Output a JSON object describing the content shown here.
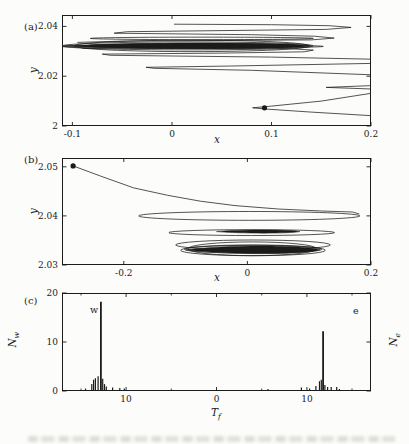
{
  "page": {
    "bg": "#fcfcfa",
    "ink": "#1b1b1b"
  },
  "panels": {
    "a": {
      "label": "(a)",
      "xlabel": "x",
      "ylabel": "y"
    },
    "b": {
      "label": "(b)",
      "xlabel": "x",
      "ylabel": "y"
    },
    "c": {
      "label": "(c)",
      "xlabel_main": "T",
      "xlabel_sub": "f",
      "ylabel_left_main": "N",
      "ylabel_left_sub": "w",
      "ylabel_right_main": "N",
      "ylabel_right_sub": "e",
      "west_label": "w",
      "east_label": "e"
    }
  },
  "chart_data": [
    {
      "id": "a",
      "type": "line",
      "xlabel": "x",
      "ylabel": "y",
      "xlim": [
        -0.1105,
        0.2
      ],
      "ylim": [
        2.0,
        2.0446
      ],
      "xticks": [
        {
          "v": -0.1,
          "label": "-0.1"
        },
        {
          "v": 0,
          "label": "0"
        },
        {
          "v": 0.1,
          "label": "0.1"
        },
        {
          "v": 0.2,
          "label": "0.2"
        }
      ],
      "yticks": [
        {
          "v": 2,
          "label": "2"
        },
        {
          "v": 2.02,
          "label": "2.02"
        },
        {
          "v": 2.04,
          "label": "2.04"
        }
      ],
      "start_marker": {
        "x": 0.093,
        "y": 2.0073
      },
      "polylines": [
        [
          [
            0.206,
            2.004
          ],
          [
            0.14,
            2.0056
          ],
          [
            0.095,
            2.0068
          ],
          [
            0.081,
            2.0073
          ],
          [
            0.1,
            2.008
          ],
          [
            0.15,
            2.01
          ],
          [
            0.206,
            2.0135
          ]
        ],
        [
          [
            0.206,
            2.0148
          ],
          [
            0.155,
            2.0155
          ],
          [
            0.206,
            2.0163
          ]
        ],
        [
          [
            0.206,
            2.0205
          ],
          [
            0.08,
            2.0224
          ],
          [
            -0.018,
            2.0232
          ],
          [
            -0.026,
            2.0236
          ],
          [
            0.06,
            2.0241
          ],
          [
            0.206,
            2.0252
          ]
        ],
        [
          [
            0.206,
            2.0268
          ],
          [
            0.1,
            2.0277
          ],
          [
            -0.062,
            2.0284
          ],
          [
            -0.07,
            2.0289
          ],
          [
            0.05,
            2.0293
          ],
          [
            0.133,
            2.0298
          ],
          [
            0.142,
            2.0305
          ],
          [
            0.12,
            2.031
          ],
          [
            -0.09,
            2.0312
          ]
        ],
        [
          [
            0.002,
            2.0409
          ],
          [
            0.1,
            2.0407
          ],
          [
            0.158,
            2.0403
          ],
          [
            0.18,
            2.0396
          ],
          [
            0.155,
            2.0388
          ],
          [
            -0.045,
            2.0379
          ],
          [
            -0.058,
            2.0373
          ],
          [
            0.08,
            2.0367
          ],
          [
            0.143,
            2.0361
          ],
          [
            0.163,
            2.0353
          ],
          [
            0.14,
            2.0346
          ],
          [
            -0.05,
            2.0341
          ],
          [
            -0.095,
            2.0336
          ]
        ]
      ],
      "loops": [
        {
          "cx": 0.016,
          "cy": 2.0322,
          "rx": 0.126,
          "ry": 0.0016
        },
        {
          "cx": 0.02,
          "cy": 2.0322,
          "rx": 0.118,
          "ry": 0.0023
        },
        {
          "cx": 0.024,
          "cy": 2.0323,
          "rx": 0.108,
          "ry": 0.0009
        },
        {
          "cx": 0.03,
          "cy": 2.0352,
          "rx": 0.112,
          "ry": 0.0005
        },
        {
          "cx": 0.02,
          "cy": 2.032,
          "rx": 0.132,
          "ry": 0.0006
        }
      ],
      "bands": [
        {
          "x0": -0.108,
          "x1": 0.139,
          "cy": 2.0322,
          "ry": 0.001
        }
      ]
    },
    {
      "id": "b",
      "type": "line",
      "xlabel": "x",
      "ylabel": "y",
      "xlim": [
        -0.3,
        0.2
      ],
      "ylim": [
        2.03,
        2.0518
      ],
      "xticks": [
        {
          "v": -0.2,
          "label": "-0.2"
        },
        {
          "v": 0,
          "label": "0"
        },
        {
          "v": 0.2,
          "label": "0.2"
        }
      ],
      "yticks": [
        {
          "v": 2.03,
          "label": "2.03"
        },
        {
          "v": 2.04,
          "label": "2.04"
        },
        {
          "v": 2.05,
          "label": "2.05"
        }
      ],
      "start_marker": {
        "x": -0.282,
        "y": 2.0502
      },
      "polylines": [
        [
          [
            -0.282,
            2.0502
          ],
          [
            -0.237,
            2.0481
          ],
          [
            -0.184,
            2.0457
          ],
          [
            -0.129,
            2.0442
          ],
          [
            -0.076,
            2.043
          ],
          [
            -0.02,
            2.0421
          ],
          [
            0.05,
            2.0414
          ],
          [
            0.12,
            2.041
          ],
          [
            0.17,
            2.0408
          ],
          [
            0.181,
            2.0404
          ]
        ]
      ],
      "loops": [
        {
          "cx": 0.003,
          "cy": 2.04,
          "rx": 0.179,
          "ry": 0.0009
        },
        {
          "cx": 0.007,
          "cy": 2.0366,
          "rx": 0.134,
          "ry": 0.0006
        },
        {
          "cx": 0.009,
          "cy": 2.0341,
          "rx": 0.125,
          "ry": 0.001
        },
        {
          "cx": 0.009,
          "cy": 2.033,
          "rx": 0.117,
          "ry": 0.0011
        },
        {
          "cx": 0.009,
          "cy": 2.0332,
          "rx": 0.111,
          "ry": 0.0008
        },
        {
          "cx": 0.008,
          "cy": 2.0333,
          "rx": 0.104,
          "ry": 0.0014
        }
      ],
      "bands": [
        {
          "x0": -0.1,
          "x1": 0.118,
          "cy": 2.0331,
          "ry": 0.0007
        },
        {
          "x0": -0.05,
          "x1": 0.085,
          "cy": 2.0368,
          "ry": 0.00028
        }
      ]
    },
    {
      "id": "c",
      "type": "bar",
      "xlabel": "T_f",
      "ylabel_left": "N_w",
      "ylabel_right": "N_e",
      "xlim": [
        -17.1,
        17.1
      ],
      "ylim": [
        0,
        20
      ],
      "xticks": [
        {
          "v": -10,
          "label": "10"
        },
        {
          "v": 0,
          "label": "0"
        },
        {
          "v": 10,
          "label": "10"
        }
      ],
      "minor_xticks": [
        -15,
        -5,
        5,
        15
      ],
      "yticks": [
        {
          "v": 0,
          "label": "0"
        },
        {
          "v": 10,
          "label": "10"
        },
        {
          "v": 20,
          "label": "20"
        }
      ],
      "annotations": [
        "w",
        "e"
      ],
      "series": [
        {
          "name": "w",
          "side": "west",
          "points": [
            [
              14.5,
              0.5
            ],
            [
              13.8,
              1.4
            ],
            [
              13.6,
              2.3
            ],
            [
              13.4,
              2.6
            ],
            [
              13.1,
              3.0
            ],
            [
              12.8,
              18.2
            ],
            [
              12.6,
              2.5
            ],
            [
              12.4,
              1.4
            ],
            [
              12.2,
              0.9
            ],
            [
              11.5,
              0.7
            ],
            [
              10.7,
              0.6
            ],
            [
              10.2,
              0.5
            ]
          ]
        },
        {
          "name": "e",
          "side": "east",
          "points": [
            [
              5.7,
              0.4
            ],
            [
              9.4,
              0.7
            ],
            [
              10.3,
              0.5
            ],
            [
              11.0,
              1.0
            ],
            [
              11.4,
              2.0
            ],
            [
              11.6,
              2.3
            ],
            [
              11.8,
              12.2
            ],
            [
              12.0,
              1.2
            ],
            [
              12.3,
              0.8
            ],
            [
              12.7,
              0.8
            ],
            [
              13.3,
              0.8
            ],
            [
              13.6,
              0.4
            ]
          ]
        }
      ]
    }
  ]
}
